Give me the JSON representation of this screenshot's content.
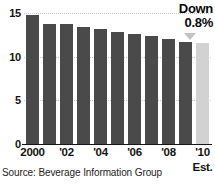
{
  "chart_data": {
    "type": "bar",
    "title": "",
    "subtitle": "",
    "xlabel": "",
    "ylabel": "",
    "categories": [
      "2000",
      "2001",
      "2002",
      "2003",
      "2004",
      "2005",
      "2006",
      "2007",
      "2008",
      "2009",
      "2010"
    ],
    "values": [
      14.8,
      13.8,
      13.8,
      13.4,
      13.2,
      12.9,
      12.6,
      12.4,
      12.0,
      11.7,
      11.6
    ],
    "ylim": [
      0,
      15.6
    ],
    "yticks": [
      0,
      5,
      10,
      15
    ],
    "ytick_labels": [
      "0",
      "5",
      "10",
      "15"
    ],
    "xtick_labels": [
      "2000",
      "'02",
      "'04",
      "'06",
      "'08",
      "'10"
    ],
    "xtick_indices": [
      0,
      2,
      4,
      6,
      8,
      10
    ],
    "grid": true,
    "legend": "none",
    "bar_colors": {
      "actual": "#4a4a4a",
      "estimate": "#d2d2d2"
    },
    "estimate_index": 10,
    "estimate_label": "Est."
  },
  "annotation": {
    "line1": "Down",
    "line2": "0.8%",
    "arrow_icon": "down-triangle-icon",
    "arrow_color": "#c4c4c4"
  },
  "source": {
    "text": "Source: Beverage Information Group"
  }
}
